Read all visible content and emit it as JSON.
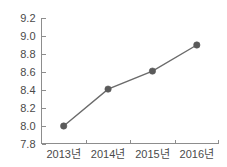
{
  "chart_data": {
    "type": "line",
    "title": "",
    "xlabel": "",
    "ylabel": "",
    "categories": [
      "2013년",
      "2014년",
      "2015년",
      "2016년"
    ],
    "values": [
      8.0,
      8.41,
      8.61,
      8.9
    ],
    "series": [
      {
        "name": "",
        "values": [
          8.0,
          8.41,
          8.61,
          8.9
        ]
      }
    ],
    "ylim": [
      7.8,
      9.2
    ],
    "y_ticks": [
      "7.8",
      "8.0",
      "8.2",
      "8.4",
      "8.6",
      "8.8",
      "9.0",
      "9.2"
    ],
    "y_tick_values": [
      7.8,
      8.0,
      8.2,
      8.4,
      8.6,
      8.8,
      9.0,
      9.2
    ],
    "x_tick_labels": [
      "2013년",
      "2014년",
      "2015년",
      "2016년"
    ],
    "grid": false,
    "legend": false,
    "legend_position": "none",
    "marker": "circle",
    "colors": {
      "line": "#6b6b6b",
      "marker": "#5a5a5a",
      "axis": "#8d8d8d",
      "text": "#4a4a4a",
      "background": "#ffffff"
    }
  }
}
